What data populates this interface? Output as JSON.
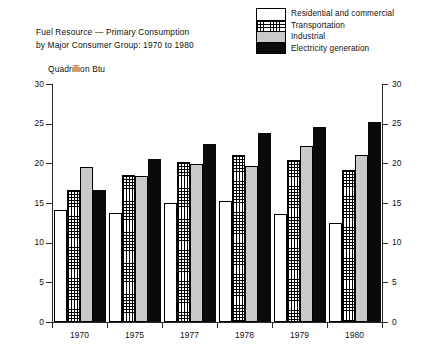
{
  "title": {
    "line1": "Fuel Resource — Primary Consumption",
    "line2": "by Major Consumer Group:  1970 to 1980"
  },
  "units_label": "Quadrillion Btu",
  "legend": {
    "items": [
      {
        "label": "Residential and commercial",
        "swatch": "white",
        "color": "#ffffff"
      },
      {
        "label": "Transportation",
        "swatch": "hatch",
        "color": "#ffffff"
      },
      {
        "label": "Industrial",
        "swatch": "gray",
        "color": "#c9c9c9"
      },
      {
        "label": "Electricity generation",
        "swatch": "black",
        "color": "#0a0a0a"
      }
    ]
  },
  "axes": {
    "y_ticks": [
      "0",
      "5",
      "10",
      "15",
      "20",
      "25",
      "30"
    ],
    "y_ticks_right": [
      "0",
      "5",
      "10",
      "15",
      "20",
      "25",
      "30"
    ]
  },
  "chart_data": {
    "type": "bar",
    "title": "Fuel Resource — Primary Consumption by Major Consumer Group:  1970 to 1980",
    "subtitle": "Quadrillion Btu",
    "xlabel": "",
    "ylabel": "Quadrillion Btu",
    "ylim": [
      0,
      30
    ],
    "ytick_step": 5,
    "grid": false,
    "legend_position": "top-right",
    "categories": [
      "1970",
      "1975",
      "1977",
      "1978",
      "1979",
      "1980"
    ],
    "series": [
      {
        "name": "Residential and commercial",
        "values": [
          14.1,
          13.8,
          15.0,
          15.3,
          13.6,
          12.5
        ]
      },
      {
        "name": "Transportation",
        "values": [
          16.7,
          18.5,
          20.2,
          21.0,
          20.4,
          19.2
        ]
      },
      {
        "name": "Industrial",
        "values": [
          19.5,
          18.4,
          19.9,
          19.7,
          22.2,
          21.0
        ]
      },
      {
        "name": "Electricity generation",
        "values": [
          16.6,
          20.5,
          22.4,
          23.8,
          24.6,
          25.2
        ]
      }
    ]
  }
}
